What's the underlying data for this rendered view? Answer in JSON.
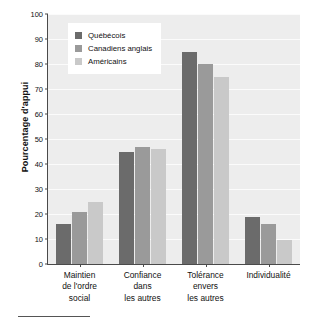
{
  "chart_data": {
    "type": "bar",
    "title": "",
    "subtitle": "",
    "xlabel": "",
    "ylabel": "Pourcentage d'appui",
    "ylim": [
      0,
      100
    ],
    "ytick_step": 10,
    "yticks": [
      0,
      10,
      20,
      30,
      40,
      50,
      60,
      70,
      80,
      90,
      100
    ],
    "grid": true,
    "grid_axis": "y",
    "legend_position": "top-left",
    "categories": [
      "Maintien\nde l'ordre\nsocial",
      "Confiance\ndans\nles autres",
      "Tolérance\nenvers\nles autres",
      "Individualité"
    ],
    "category_labels": [
      [
        "Maintien",
        "de l'ordre",
        "social"
      ],
      [
        "Confiance",
        "dans",
        "les autres"
      ],
      [
        "Tolérance",
        "envers",
        "les autres"
      ],
      [
        "Individualité"
      ]
    ],
    "series": [
      {
        "name": "Québécois",
        "color": "#6b6b6b",
        "values": [
          16,
          45,
          85,
          19
        ]
      },
      {
        "name": "Canadiens anglais",
        "color": "#9a9a9a",
        "values": [
          21,
          47,
          80,
          16
        ]
      },
      {
        "name": "Américains",
        "color": "#c9c9c9",
        "values": [
          25,
          46,
          75,
          9.5
        ]
      }
    ],
    "plot_background": "#ededed",
    "gridline_color": "#fbfbfb",
    "axis_color": "#4a4a4a",
    "annotations": []
  },
  "axis": {
    "y_title": "Pourcentage d'appui"
  },
  "legend": {
    "items": [
      {
        "label": "Québécois"
      },
      {
        "label": "Canadiens anglais"
      },
      {
        "label": "Américains"
      }
    ]
  }
}
